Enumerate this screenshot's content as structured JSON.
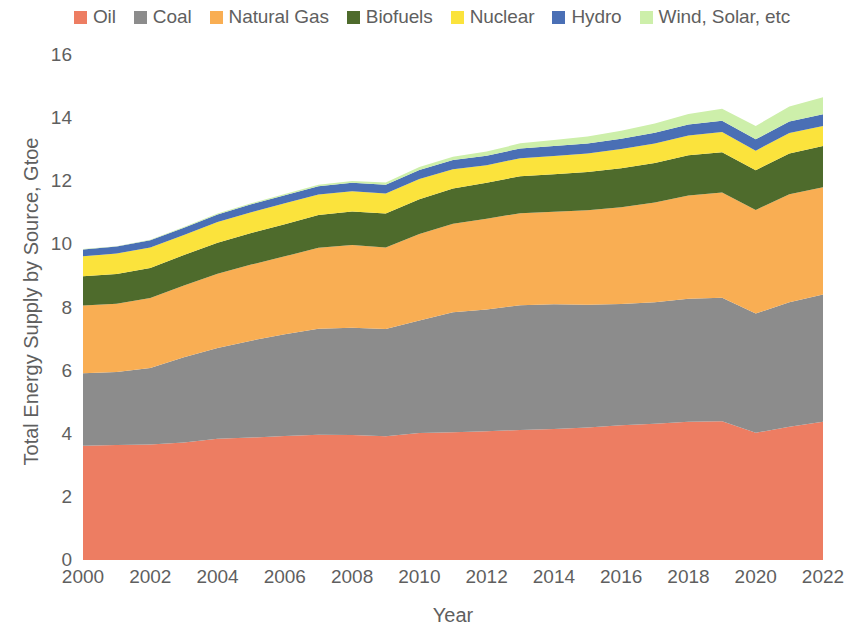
{
  "chart_data": {
    "type": "area",
    "stacked": true,
    "title": "",
    "xlabel": "Year",
    "ylabel": "Total Energy Supply by Source, Gtoe",
    "xlim": [
      2000,
      2022
    ],
    "ylim": [
      0,
      16
    ],
    "y_ticks": [
      0,
      2,
      4,
      6,
      8,
      10,
      12,
      14,
      16
    ],
    "x_ticks": [
      2000,
      2002,
      2004,
      2006,
      2008,
      2010,
      2012,
      2014,
      2016,
      2018,
      2020,
      2022
    ],
    "grid": false,
    "legend_position": "top",
    "x": [
      2000,
      2001,
      2002,
      2003,
      2004,
      2005,
      2006,
      2007,
      2008,
      2009,
      2010,
      2011,
      2012,
      2013,
      2014,
      2015,
      2016,
      2017,
      2018,
      2019,
      2020,
      2021,
      2022
    ],
    "series": [
      {
        "name": "Oil",
        "color": "#ED7D62",
        "values": [
          3.62,
          3.64,
          3.66,
          3.72,
          3.84,
          3.88,
          3.93,
          3.97,
          3.96,
          3.92,
          4.02,
          4.05,
          4.08,
          4.12,
          4.15,
          4.2,
          4.27,
          4.32,
          4.38,
          4.4,
          4.03,
          4.22,
          4.38
        ]
      },
      {
        "name": "Coal",
        "color": "#8C8C8C",
        "values": [
          2.3,
          2.32,
          2.42,
          2.7,
          2.88,
          3.07,
          3.22,
          3.36,
          3.4,
          3.4,
          3.57,
          3.8,
          3.86,
          3.95,
          3.95,
          3.89,
          3.84,
          3.85,
          3.9,
          3.91,
          3.78,
          3.95,
          4.03
        ]
      },
      {
        "name": "Natural Gas",
        "color": "#F9AE53",
        "values": [
          2.14,
          2.16,
          2.22,
          2.28,
          2.35,
          2.41,
          2.47,
          2.56,
          2.62,
          2.58,
          2.74,
          2.8,
          2.87,
          2.92,
          2.93,
          2.99,
          3.07,
          3.16,
          3.27,
          3.33,
          3.28,
          3.42,
          3.4
        ]
      },
      {
        "name": "Biofuels",
        "color": "#4E6B2C",
        "values": [
          0.93,
          0.94,
          0.95,
          0.96,
          0.98,
          1.0,
          1.02,
          1.04,
          1.06,
          1.08,
          1.1,
          1.12,
          1.14,
          1.17,
          1.19,
          1.21,
          1.23,
          1.25,
          1.27,
          1.28,
          1.26,
          1.29,
          1.31
        ]
      },
      {
        "name": "Nuclear",
        "color": "#FBE33C",
        "values": [
          0.63,
          0.65,
          0.65,
          0.64,
          0.66,
          0.66,
          0.66,
          0.65,
          0.64,
          0.63,
          0.64,
          0.61,
          0.56,
          0.57,
          0.58,
          0.59,
          0.61,
          0.62,
          0.63,
          0.64,
          0.62,
          0.65,
          0.63
        ]
      },
      {
        "name": "Hydro",
        "color": "#4A6FB5",
        "values": [
          0.22,
          0.22,
          0.23,
          0.23,
          0.24,
          0.25,
          0.26,
          0.26,
          0.27,
          0.28,
          0.29,
          0.29,
          0.3,
          0.31,
          0.32,
          0.32,
          0.33,
          0.34,
          0.35,
          0.36,
          0.36,
          0.36,
          0.37
        ]
      },
      {
        "name": "Wind, Solar, etc",
        "color": "#CDEFAA",
        "values": [
          0.01,
          0.01,
          0.02,
          0.02,
          0.03,
          0.03,
          0.04,
          0.05,
          0.06,
          0.07,
          0.09,
          0.11,
          0.13,
          0.16,
          0.19,
          0.22,
          0.25,
          0.29,
          0.33,
          0.38,
          0.42,
          0.48,
          0.54
        ]
      }
    ]
  },
  "legend": {
    "items": [
      {
        "label": "Oil",
        "color": "#ED7D62"
      },
      {
        "label": "Coal",
        "color": "#8C8C8C"
      },
      {
        "label": "Natural Gas",
        "color": "#F9AE53"
      },
      {
        "label": "Biofuels",
        "color": "#4E6B2C"
      },
      {
        "label": "Nuclear",
        "color": "#FBE33C"
      },
      {
        "label": "Hydro",
        "color": "#4A6FB5"
      },
      {
        "label": "Wind, Solar, etc",
        "color": "#CDEFAA"
      }
    ]
  },
  "axes": {
    "y_title": "Total Energy Supply by Source, Gtoe",
    "x_title": "Year",
    "y_tick_labels": [
      "16",
      "14",
      "12",
      "10",
      "8",
      "6",
      "4",
      "2",
      "0"
    ],
    "x_tick_labels": [
      "2000",
      "2002",
      "2004",
      "2006",
      "2008",
      "2010",
      "2012",
      "2014",
      "2016",
      "2018",
      "2020",
      "2022"
    ]
  }
}
